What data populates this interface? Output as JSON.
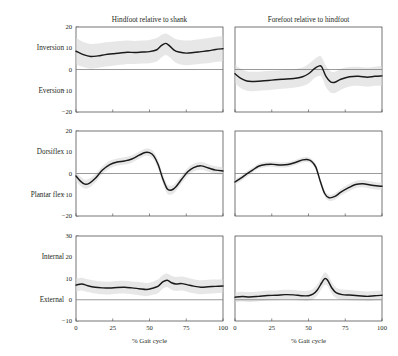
{
  "figure": {
    "columns": [
      {
        "id": "hindfoot-shank",
        "title": "Hindfoot relative to shank"
      },
      {
        "id": "forefoot-hindfoot",
        "title": "Forefoot relative to hindfoot"
      }
    ],
    "rows": [
      {
        "id": "inversion-eversion",
        "top_label": "Inversion",
        "bottom_label": "Eversion",
        "yticks": [
          20,
          10,
          0,
          -10,
          -20
        ],
        "ylim": [
          -20,
          20
        ]
      },
      {
        "id": "dorsiflex-plantarflex",
        "top_label": "Dorsiflex",
        "bottom_label": "Plantar flex",
        "yticks": [
          20,
          10,
          0,
          -10,
          -20
        ],
        "ylim": [
          -20,
          20
        ]
      },
      {
        "id": "internal-external",
        "top_label": "Internal",
        "bottom_label": "External",
        "yticks": [
          30,
          20,
          10,
          0,
          -10
        ],
        "ylim": [
          -10,
          30
        ]
      }
    ],
    "xticks": [
      0,
      25,
      50,
      75,
      100
    ],
    "xlim": [
      0,
      100
    ],
    "xlabel": "% Gait cycle",
    "colors": {
      "mean_curve": "#1a1a1a",
      "band": "#d9d9d9",
      "frame": "#3a3a3a",
      "zero_line": "#6f6f6f",
      "text": "#231f20",
      "background": "#ffffff"
    }
  },
  "chart_data": [
    {
      "type": "line",
      "id": "hindfoot-inversion-eversion",
      "title": "Hindfoot relative to shank",
      "row": "Inversion / Eversion",
      "xlabel": "% Gait cycle",
      "ylabel": "Inversion (+) / Eversion (−), degrees",
      "xlim": [
        0,
        100
      ],
      "ylim": [
        -20,
        20
      ],
      "xticks": [
        0,
        25,
        50,
        75,
        100
      ],
      "yticks": [
        20,
        10,
        0,
        -10,
        -20
      ],
      "grid": false,
      "legend": "none",
      "x": [
        0,
        5,
        10,
        15,
        20,
        25,
        30,
        35,
        40,
        45,
        50,
        55,
        58,
        61,
        64,
        67,
        70,
        75,
        80,
        85,
        90,
        95,
        100
      ],
      "series": [
        {
          "name": "mean",
          "values": [
            8.6,
            7.0,
            6.1,
            6.4,
            7.0,
            7.4,
            7.8,
            8.1,
            8.0,
            8.2,
            8.4,
            9.3,
            11.2,
            12.3,
            10.9,
            9.0,
            8.2,
            7.7,
            8.0,
            8.4,
            8.8,
            9.4,
            9.8
          ]
        },
        {
          "name": "band_upper",
          "values": [
            14.8,
            13.0,
            12.0,
            12.2,
            12.8,
            13.1,
            13.4,
            13.6,
            13.4,
            13.6,
            13.9,
            14.8,
            16.2,
            17.0,
            16.0,
            14.6,
            14.0,
            13.6,
            13.9,
            14.3,
            14.8,
            15.4,
            15.8
          ]
        },
        {
          "name": "band_lower",
          "values": [
            2.4,
            1.2,
            0.4,
            0.8,
            1.4,
            1.8,
            2.2,
            2.6,
            2.6,
            2.8,
            3.0,
            3.8,
            5.6,
            6.8,
            5.6,
            3.6,
            2.6,
            2.0,
            2.3,
            2.7,
            3.0,
            3.5,
            3.9
          ]
        }
      ]
    },
    {
      "type": "line",
      "id": "forefoot-inversion-eversion",
      "title": "Forefoot relative to hindfoot",
      "row": "Inversion / Eversion",
      "xlabel": "% Gait cycle",
      "ylabel": "Inversion (+) / Eversion (−), degrees",
      "xlim": [
        0,
        100
      ],
      "ylim": [
        -20,
        20
      ],
      "xticks": [
        0,
        25,
        50,
        75,
        100
      ],
      "yticks": [
        20,
        10,
        0,
        -10,
        -20
      ],
      "grid": false,
      "legend": "none",
      "x": [
        0,
        4,
        8,
        12,
        18,
        25,
        32,
        40,
        46,
        50,
        54,
        57,
        59,
        62,
        65,
        68,
        72,
        78,
        84,
        90,
        95,
        100
      ],
      "series": [
        {
          "name": "mean",
          "values": [
            -2.0,
            -4.2,
            -5.4,
            -5.6,
            -5.4,
            -5.0,
            -4.6,
            -4.2,
            -3.4,
            -2.0,
            0.4,
            1.6,
            1.2,
            -3.4,
            -5.8,
            -6.0,
            -4.6,
            -3.4,
            -3.2,
            -3.6,
            -3.2,
            -3.0
          ]
        },
        {
          "name": "band_upper",
          "values": [
            2.4,
            0.4,
            -0.8,
            -1.1,
            -0.9,
            -0.6,
            -0.3,
            0.1,
            1.0,
            2.6,
            4.8,
            6.2,
            5.8,
            1.6,
            -0.8,
            -1.1,
            0.3,
            1.2,
            1.3,
            0.9,
            1.3,
            1.6
          ]
        },
        {
          "name": "band_lower",
          "values": [
            -6.4,
            -8.8,
            -10.0,
            -10.2,
            -9.9,
            -9.5,
            -9.0,
            -8.6,
            -7.8,
            -6.6,
            -4.0,
            -3.0,
            -3.4,
            -8.4,
            -10.8,
            -11.0,
            -9.5,
            -8.0,
            -7.7,
            -8.1,
            -7.7,
            -7.6
          ]
        }
      ]
    },
    {
      "type": "line",
      "id": "hindfoot-dorsiflex-plantarflex",
      "title": "Hindfoot relative to shank",
      "row": "Dorsiflex / Plantar flex",
      "xlabel": "% Gait cycle",
      "ylabel": "Dorsiflex (+) / Plantar flex (−), degrees",
      "xlim": [
        0,
        100
      ],
      "ylim": [
        -20,
        20
      ],
      "xticks": [
        0,
        25,
        50,
        75,
        100
      ],
      "yticks": [
        20,
        10,
        0,
        -10,
        -20
      ],
      "grid": false,
      "legend": "none",
      "x": [
        0,
        3,
        6,
        9,
        13,
        18,
        23,
        28,
        33,
        38,
        43,
        47,
        50,
        53,
        56,
        59,
        62,
        65,
        68,
        72,
        76,
        80,
        85,
        90,
        95,
        100
      ],
      "series": [
        {
          "name": "mean",
          "values": [
            -1.2,
            -3.6,
            -5.0,
            -4.6,
            -2.4,
            1.6,
            4.2,
            5.4,
            5.9,
            6.8,
            8.6,
            9.9,
            9.8,
            8.2,
            4.0,
            -2.4,
            -7.2,
            -7.8,
            -6.2,
            -2.6,
            0.8,
            2.8,
            3.6,
            2.6,
            1.6,
            1.2
          ]
        },
        {
          "name": "band_upper",
          "values": [
            1.0,
            -1.4,
            -2.9,
            -2.5,
            -0.4,
            3.4,
            6.0,
            7.1,
            7.6,
            8.5,
            10.3,
            11.6,
            11.6,
            10.1,
            6.0,
            -0.2,
            -5.0,
            -5.7,
            -4.2,
            -0.7,
            2.6,
            4.6,
            5.4,
            4.4,
            3.4,
            3.0
          ]
        },
        {
          "name": "band_lower",
          "values": [
            -3.4,
            -5.8,
            -7.1,
            -6.7,
            -4.4,
            -0.2,
            2.4,
            3.7,
            4.2,
            5.1,
            6.9,
            8.2,
            8.0,
            6.3,
            2.0,
            -4.6,
            -9.4,
            -9.9,
            -8.2,
            -4.5,
            -1.0,
            1.0,
            1.8,
            0.8,
            -0.2,
            -0.6
          ]
        }
      ]
    },
    {
      "type": "line",
      "id": "forefoot-dorsiflex-plantarflex",
      "title": "Forefoot relative to hindfoot",
      "row": "Dorsiflex / Plantar flex",
      "xlabel": "% Gait cycle",
      "ylabel": "Dorsiflex (+) / Plantar flex (−), degrees",
      "xlim": [
        0,
        100
      ],
      "ylim": [
        -20,
        20
      ],
      "xticks": [
        0,
        25,
        50,
        75,
        100
      ],
      "yticks": [
        20,
        10,
        0,
        -10,
        -20
      ],
      "grid": false,
      "legend": "none",
      "x": [
        0,
        4,
        8,
        12,
        16,
        21,
        26,
        31,
        36,
        41,
        46,
        49,
        52,
        55,
        58,
        61,
        64,
        68,
        72,
        77,
        82,
        87,
        92,
        96,
        100
      ],
      "series": [
        {
          "name": "mean",
          "values": [
            -4.0,
            -2.2,
            -0.2,
            1.6,
            3.4,
            4.2,
            4.3,
            4.0,
            4.2,
            5.2,
            6.4,
            6.6,
            5.8,
            3.0,
            -3.6,
            -9.4,
            -11.4,
            -10.8,
            -8.8,
            -6.8,
            -5.2,
            -4.8,
            -5.4,
            -5.8,
            -6.0
          ]
        },
        {
          "name": "band_upper",
          "values": [
            -2.6,
            -0.9,
            1.1,
            2.8,
            4.6,
            5.4,
            5.5,
            5.2,
            5.4,
            6.4,
            7.6,
            7.8,
            7.0,
            4.3,
            -2.2,
            -8.0,
            -10.0,
            -9.3,
            -7.2,
            -5.1,
            -3.5,
            -3.1,
            -3.7,
            -4.1,
            -4.3
          ]
        },
        {
          "name": "band_lower",
          "values": [
            -5.4,
            -3.5,
            -1.5,
            0.4,
            2.2,
            3.0,
            3.1,
            2.8,
            3.0,
            4.0,
            5.2,
            5.4,
            4.6,
            1.7,
            -5.0,
            -10.8,
            -12.8,
            -12.3,
            -10.4,
            -8.5,
            -6.9,
            -6.5,
            -7.1,
            -7.5,
            -7.7
          ]
        }
      ]
    },
    {
      "type": "line",
      "id": "hindfoot-internal-external",
      "title": "Hindfoot relative to shank",
      "row": "Internal / External",
      "xlabel": "% Gait cycle",
      "ylabel": "Internal (+) / External (−), degrees",
      "xlim": [
        0,
        100
      ],
      "ylim": [
        -10,
        30
      ],
      "xticks": [
        0,
        25,
        50,
        75,
        100
      ],
      "yticks": [
        30,
        20,
        10,
        0,
        -10
      ],
      "grid": false,
      "legend": "none",
      "x": [
        0,
        4,
        8,
        13,
        18,
        23,
        28,
        33,
        38,
        43,
        48,
        52,
        56,
        59,
        62,
        65,
        68,
        72,
        76,
        80,
        85,
        90,
        95,
        100
      ],
      "series": [
        {
          "name": "mean",
          "values": [
            6.9,
            7.4,
            6.6,
            5.9,
            5.6,
            5.5,
            5.8,
            5.9,
            5.6,
            5.2,
            4.8,
            5.4,
            6.4,
            8.4,
            9.2,
            8.0,
            7.4,
            7.6,
            7.0,
            6.4,
            5.9,
            6.1,
            6.3,
            6.5
          ]
        },
        {
          "name": "band_upper",
          "values": [
            10.0,
            10.4,
            9.6,
            8.9,
            8.6,
            8.5,
            8.8,
            8.9,
            8.6,
            8.3,
            7.9,
            8.5,
            9.6,
            11.6,
            12.4,
            11.3,
            10.7,
            10.9,
            10.3,
            9.7,
            9.2,
            9.4,
            9.5,
            9.7
          ]
        },
        {
          "name": "band_lower",
          "values": [
            3.8,
            4.4,
            3.6,
            2.9,
            2.6,
            2.5,
            2.8,
            2.9,
            2.6,
            2.1,
            1.7,
            2.3,
            3.2,
            5.2,
            6.0,
            4.7,
            4.1,
            4.3,
            3.7,
            3.1,
            2.6,
            2.8,
            3.1,
            3.3
          ]
        }
      ]
    },
    {
      "type": "line",
      "id": "forefoot-internal-external",
      "title": "Forefoot relative to hindfoot",
      "row": "Internal / External",
      "xlabel": "% Gait cycle",
      "ylabel": "Internal (+) / External (−), degrees",
      "xlim": [
        0,
        100
      ],
      "ylim": [
        -10,
        30
      ],
      "xticks": [
        0,
        25,
        50,
        75,
        100
      ],
      "yticks": [
        30,
        20,
        10,
        0,
        -10
      ],
      "grid": false,
      "legend": "none",
      "x": [
        0,
        5,
        10,
        16,
        22,
        28,
        34,
        40,
        45,
        50,
        53,
        56,
        59,
        61,
        63,
        66,
        69,
        73,
        78,
        84,
        90,
        95,
        100
      ],
      "series": [
        {
          "name": "mean",
          "values": [
            1.2,
            1.5,
            1.3,
            1.6,
            2.0,
            2.1,
            2.4,
            2.3,
            1.9,
            1.9,
            2.6,
            4.6,
            8.0,
            9.9,
            9.2,
            5.4,
            3.2,
            2.4,
            2.2,
            1.9,
            1.6,
            1.9,
            2.1
          ]
        },
        {
          "name": "band_upper",
          "values": [
            3.5,
            3.8,
            3.6,
            3.9,
            4.3,
            4.4,
            4.7,
            4.6,
            4.2,
            4.3,
            5.1,
            7.2,
            10.8,
            12.8,
            12.0,
            8.1,
            5.7,
            4.8,
            4.6,
            4.2,
            3.9,
            4.2,
            4.4
          ]
        },
        {
          "name": "band_lower",
          "values": [
            -1.1,
            -0.8,
            -1.0,
            -0.7,
            -0.3,
            -0.2,
            0.1,
            0.0,
            -0.4,
            -0.5,
            0.1,
            2.0,
            5.2,
            7.0,
            6.4,
            2.7,
            0.7,
            0.0,
            -0.2,
            -0.4,
            -0.7,
            -0.4,
            -0.2
          ]
        }
      ]
    }
  ]
}
